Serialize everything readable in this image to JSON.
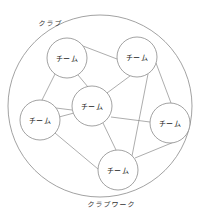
{
  "diagram": {
    "outer": {
      "label_top": "クラブ",
      "label_bottom": "クラブワーク",
      "cx": 100,
      "cy": 106,
      "rx": 92,
      "ry": 91
    },
    "nodes": [
      {
        "id": "team-top-left",
        "label": "チーム",
        "cx": 67,
        "cy": 58,
        "r": 20
      },
      {
        "id": "team-top-right",
        "label": "チーム",
        "cx": 137,
        "cy": 57,
        "r": 20
      },
      {
        "id": "team-center",
        "label": "チーム",
        "cx": 92,
        "cy": 106,
        "r": 20
      },
      {
        "id": "team-left",
        "label": "チーム",
        "cx": 40,
        "cy": 120,
        "r": 20
      },
      {
        "id": "team-right",
        "label": "チーム",
        "cx": 170,
        "cy": 123,
        "r": 20
      },
      {
        "id": "team-bottom",
        "label": "チーム",
        "cx": 118,
        "cy": 170,
        "r": 20
      }
    ],
    "edges": [
      {
        "from": "team-top-left",
        "to": "team-top-right",
        "x1": 83,
        "y1": 46,
        "x2": 117,
        "y2": 59
      },
      {
        "from": "team-top-left",
        "to": "team-left",
        "x1": 55,
        "y1": 74,
        "x2": 42,
        "y2": 100
      },
      {
        "from": "team-top-left",
        "to": "team-center",
        "x1": 78,
        "y1": 75,
        "x2": 88,
        "y2": 87
      },
      {
        "from": "team-top-right",
        "to": "team-center",
        "x1": 130,
        "y1": 76,
        "x2": 107,
        "y2": 93
      },
      {
        "from": "team-top-right",
        "to": "team-right",
        "x1": 156,
        "y1": 63,
        "x2": 171,
        "y2": 103
      },
      {
        "from": "team-top-right",
        "to": "team-bottom",
        "x1": 148,
        "y1": 74,
        "x2": 132,
        "y2": 156
      },
      {
        "from": "team-left",
        "to": "team-center",
        "x1": 56,
        "y1": 108,
        "x2": 72,
        "y2": 110
      },
      {
        "from": "team-left",
        "to": "team-center",
        "x1": 59,
        "y1": 117,
        "x2": 74,
        "y2": 113
      },
      {
        "from": "team-left",
        "to": "team-bottom",
        "x1": 55,
        "y1": 133,
        "x2": 98,
        "y2": 169
      },
      {
        "from": "team-center",
        "to": "team-right",
        "x1": 111,
        "y1": 117,
        "x2": 150,
        "y2": 122
      },
      {
        "from": "team-center",
        "to": "team-bottom",
        "x1": 103,
        "y1": 123,
        "x2": 116,
        "y2": 150
      },
      {
        "from": "team-bottom",
        "to": "team-right",
        "x1": 135,
        "y1": 158,
        "x2": 174,
        "y2": 142
      }
    ],
    "colors": {
      "stroke": "#8a8a8a",
      "background": "#ffffff"
    }
  }
}
